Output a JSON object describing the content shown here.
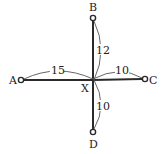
{
  "diagram": {
    "center": {
      "id": "X",
      "label": "X",
      "x": 93,
      "y": 80
    },
    "nodes": [
      {
        "id": "A",
        "label": "A",
        "x": 21,
        "y": 80
      },
      {
        "id": "B",
        "label": "B",
        "x": 93,
        "y": 18
      },
      {
        "id": "C",
        "label": "C",
        "x": 145,
        "y": 79
      },
      {
        "id": "D",
        "label": "D",
        "x": 93,
        "y": 132
      }
    ],
    "edges": [
      {
        "from": "X",
        "to": "A",
        "length": "15"
      },
      {
        "from": "X",
        "to": "B",
        "length": "12"
      },
      {
        "from": "X",
        "to": "C",
        "length": "10"
      },
      {
        "from": "X",
        "to": "D",
        "length": "10"
      }
    ],
    "colors": {
      "line": "#2a2a2a",
      "arc": "#555555",
      "background": "#ffffff"
    }
  }
}
